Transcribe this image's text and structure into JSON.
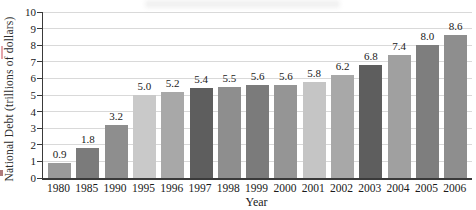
{
  "figure": {
    "background": "#ffffff",
    "axis_color": "#3a3a3a",
    "grid_color": "#d9d9d9",
    "text_color": "#1a1a1a"
  },
  "chart_data": {
    "type": "bar",
    "title": "",
    "xlabel": "Year",
    "ylabel": "National Debt (trillions of dollars)",
    "categories": [
      "1980",
      "1985",
      "1990",
      "1995",
      "1996",
      "1997",
      "1998",
      "1999",
      "2000",
      "2001",
      "2002",
      "2003",
      "2004",
      "2005",
      "2006"
    ],
    "values": [
      0.9,
      1.8,
      3.2,
      5.0,
      5.2,
      5.4,
      5.5,
      5.6,
      5.6,
      5.8,
      6.2,
      6.8,
      7.4,
      8.0,
      8.6
    ],
    "value_labels": [
      "0.9",
      "1.8",
      "3.2",
      "5.0",
      "5.2",
      "5.4",
      "5.5",
      "5.6",
      "5.6",
      "5.8",
      "6.2",
      "6.8",
      "7.4",
      "8.0",
      "8.6"
    ],
    "bar_colors": [
      "#9a9a9a",
      "#7b7b7b",
      "#8e8e8e",
      "#c9c9c9",
      "#a8a8a8",
      "#5e5e5e",
      "#8e8e8e",
      "#7b7b7b",
      "#959595",
      "#c5c5c5",
      "#a8a8a8",
      "#5e5e5e",
      "#a0a0a0",
      "#7e7e7e",
      "#8e8e8e"
    ],
    "ylim": [
      0,
      10
    ],
    "yticks": [
      0,
      1,
      2,
      3,
      4,
      5,
      6,
      7,
      8,
      9,
      10
    ],
    "grid": true,
    "legend": false
  }
}
